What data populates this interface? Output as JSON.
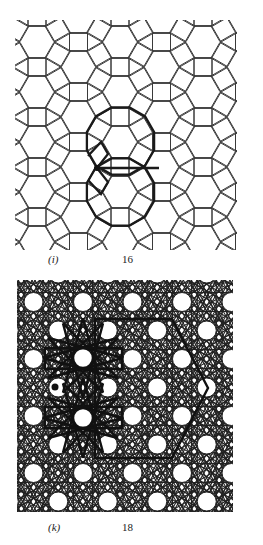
{
  "figures": [
    {
      "id": "i",
      "label": "(i)",
      "number": "16",
      "label_pos": [
        48,
        253
      ],
      "number_pos": [
        122,
        253
      ],
      "description": "3.4.6.4 tiling of hexagons, squares and triangles with two bold dodecagon outlines and a marked vertex",
      "clip": [
        15,
        20,
        237,
        250
      ],
      "lattice": {
        "origin": [
          37,
          42
        ],
        "dx": 41.5,
        "dy": 50,
        "side": 18
      },
      "bold_dodecagon_centers": [
        [
          120.5,
          141
        ],
        [
          120.5,
          192
        ]
      ],
      "marked_vertex": [
        97,
        168
      ],
      "line_color": "#3a3a3a",
      "bold_color": "#1a1a1a"
    },
    {
      "id": "k",
      "label": "(k)",
      "number": "18",
      "label_pos": [
        48,
        521
      ],
      "number_pos": [
        122,
        521
      ],
      "description": "Interlaced star-line pattern on a hexagonal lattice of circles, with bold 12-pointed stars, bold rectangles and a bold half-hexagon outline",
      "clip": [
        17,
        280,
        233,
        512
      ],
      "circle_lattice": {
        "origin": [
          83,
          302
        ],
        "dx": 49.5,
        "dy": 28.5,
        "radius": 9.5
      },
      "bold_stars": [
        [
          83,
          358
        ],
        [
          83,
          418
        ]
      ],
      "bold_rects": [
        [
          45,
          348,
          122,
          369
        ],
        [
          45,
          407,
          122,
          428
        ]
      ],
      "bold_outline": [
        [
          95,
          319
        ],
        [
          172,
          319
        ],
        [
          208,
          388
        ],
        [
          172,
          458
        ],
        [
          95,
          458
        ]
      ],
      "marked_vertex": [
        55,
        387
      ],
      "line_color": "#222222",
      "bold_color": "#111111"
    }
  ]
}
